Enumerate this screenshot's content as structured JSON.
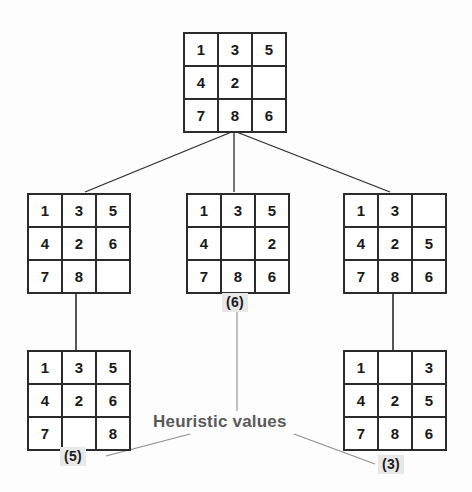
{
  "diagram": {
    "caption": "Heuristic values",
    "nodes": [
      {
        "id": "root",
        "name": "root-state",
        "tiles": [
          "1",
          "3",
          "5",
          "4",
          "2",
          "",
          "7",
          "8",
          "6"
        ],
        "heuristic": null
      },
      {
        "id": "child-left",
        "name": "child-state-left",
        "tiles": [
          "1",
          "3",
          "5",
          "4",
          "2",
          "6",
          "7",
          "8",
          ""
        ],
        "heuristic": null
      },
      {
        "id": "child-middle",
        "name": "child-state-middle",
        "tiles": [
          "1",
          "3",
          "5",
          "4",
          "",
          "2",
          "7",
          "8",
          "6"
        ],
        "heuristic": "(6)"
      },
      {
        "id": "child-right",
        "name": "child-state-right",
        "tiles": [
          "1",
          "3",
          "",
          "4",
          "2",
          "5",
          "7",
          "8",
          "6"
        ],
        "heuristic": null
      },
      {
        "id": "leaf-left",
        "name": "leaf-state-left",
        "tiles": [
          "1",
          "3",
          "5",
          "4",
          "2",
          "6",
          "7",
          "",
          "8"
        ],
        "heuristic": "(5)"
      },
      {
        "id": "leaf-right",
        "name": "leaf-state-right",
        "tiles": [
          "1",
          "",
          "3",
          "4",
          "2",
          "5",
          "7",
          "8",
          "6"
        ],
        "heuristic": "(3)"
      }
    ]
  }
}
